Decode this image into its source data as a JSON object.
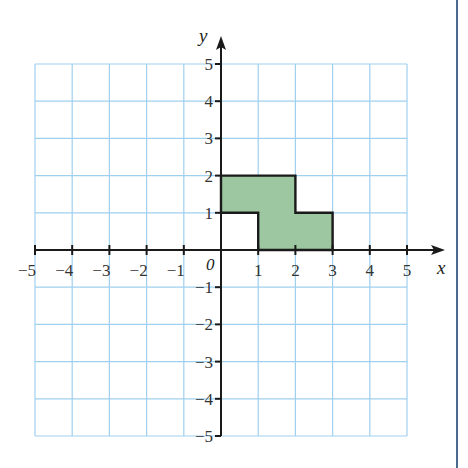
{
  "figure": {
    "x_axis_label": "x",
    "y_axis_label": "y",
    "origin_label": "0",
    "x_ticks": [
      "−5",
      "−4",
      "−3",
      "−2",
      "−1",
      "1",
      "2",
      "3",
      "4",
      "5"
    ],
    "y_ticks": [
      "5",
      "4",
      "3",
      "2",
      "1",
      "−1",
      "−2",
      "−3",
      "−4",
      "−5"
    ],
    "x_tick_values": [
      -5,
      -4,
      -3,
      -2,
      -1,
      1,
      2,
      3,
      4,
      5
    ],
    "y_tick_values": [
      5,
      4,
      3,
      2,
      1,
      -1,
      -2,
      -3,
      -4,
      -5
    ],
    "range": {
      "xmin": -5,
      "xmax": 5,
      "ymin": -5,
      "ymax": 5
    },
    "shape": {
      "name": "shaded-polygon",
      "vertices": [
        [
          0,
          1
        ],
        [
          0,
          2
        ],
        [
          2,
          2
        ],
        [
          2,
          1
        ],
        [
          3,
          1
        ],
        [
          3,
          0
        ],
        [
          1,
          0
        ],
        [
          1,
          1
        ]
      ],
      "fill": "#9cc7a0",
      "stroke": "#1a1a1a"
    },
    "colors": {
      "grid": "#9fd0ee",
      "axis": "#1a1a1a",
      "right_border": "#4a6a8f"
    }
  }
}
